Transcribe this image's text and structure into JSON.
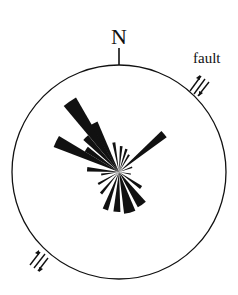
{
  "diagram": {
    "type": "rose-diagram",
    "north_label": "N",
    "fault_label": "fault",
    "colors": {
      "ink": "#111111",
      "background": "#ffffff"
    },
    "center": {
      "x": 119,
      "y": 172
    },
    "radius": 107
  },
  "chart_data": {
    "type": "rose",
    "title": "",
    "orientation_reference": "N",
    "annotations": [
      "fault (sinistral shear arrows at NE and SW)"
    ],
    "petals": [
      {
        "bearing": 325,
        "half_width": 5,
        "length": 86
      },
      {
        "bearing": 333,
        "half_width": 4,
        "length": 55
      },
      {
        "bearing": 316,
        "half_width": 4,
        "length": 48
      },
      {
        "bearing": 296,
        "half_width": 5,
        "length": 70
      },
      {
        "bearing": 305,
        "half_width": 4,
        "length": 40
      },
      {
        "bearing": 350,
        "half_width": 3,
        "length": 30
      },
      {
        "bearing": 5,
        "half_width": 3,
        "length": 26
      },
      {
        "bearing": 18,
        "half_width": 3,
        "length": 24
      },
      {
        "bearing": 30,
        "half_width": 3,
        "length": 20
      },
      {
        "bearing": 50,
        "half_width": 4,
        "length": 59
      },
      {
        "bearing": 70,
        "half_width": 3,
        "length": 14
      },
      {
        "bearing": 100,
        "half_width": 3,
        "length": 12
      },
      {
        "bearing": 125,
        "half_width": 4,
        "length": 27
      },
      {
        "bearing": 145,
        "half_width": 7,
        "length": 40
      },
      {
        "bearing": 165,
        "half_width": 8,
        "length": 42
      },
      {
        "bearing": 183,
        "half_width": 5,
        "length": 40
      },
      {
        "bearing": 200,
        "half_width": 4,
        "length": 40
      },
      {
        "bearing": 220,
        "half_width": 3,
        "length": 28
      },
      {
        "bearing": 240,
        "half_width": 3,
        "length": 24
      },
      {
        "bearing": 262,
        "half_width": 3,
        "length": 18
      },
      {
        "bearing": 275,
        "half_width": 4,
        "length": 32
      }
    ]
  }
}
